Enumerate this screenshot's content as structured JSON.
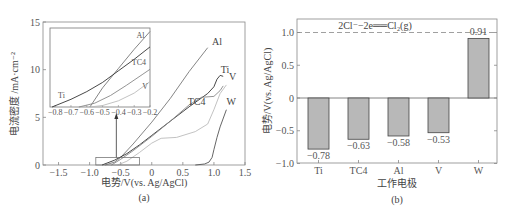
{
  "chart_data": [
    {
      "type": "line",
      "panel_label": "(a)",
      "xlabel": "电势/V(vs. Ag/AgCl)",
      "ylabel": "电流密度 /mA·cm⁻²",
      "xlim": [
        -1.75,
        1.5
      ],
      "ylim": [
        0,
        15
      ],
      "xticks": [
        "-1.5",
        "-1.0",
        "-0.5",
        "0",
        "0.5",
        "1.0",
        "1.5"
      ],
      "xtick_values": [
        -1.5,
        -1.0,
        -0.5,
        0,
        0.5,
        1.0,
        1.5
      ],
      "yticks": [
        "0",
        "5",
        "10",
        "15"
      ],
      "ytick_values": [
        0,
        5,
        10,
        15
      ],
      "series": [
        {
          "name": "Al",
          "color": "#777777",
          "x": [
            -0.75,
            -0.6,
            -0.5,
            -0.3,
            0,
            0.3,
            0.6,
            0.9
          ],
          "y": [
            0,
            0.3,
            0.8,
            2.2,
            4.5,
            7,
            9.8,
            12.3
          ]
        },
        {
          "name": "Ti",
          "color": "#333333",
          "x": [
            -0.8,
            -0.6,
            -0.4,
            -0.2,
            0,
            0.3,
            0.6,
            0.9,
            1.0,
            1.05,
            1.1,
            1.15
          ],
          "y": [
            0,
            0.5,
            1.2,
            2.1,
            3.1,
            4.6,
            6.1,
            7.5,
            8.2,
            9.0,
            9.4,
            9.3
          ]
        },
        {
          "name": "TC4",
          "color": "#888888",
          "x": [
            -0.65,
            -0.5,
            -0.3,
            0,
            0.3,
            0.6,
            0.8,
            1.0,
            1.1,
            1.15
          ],
          "y": [
            0,
            0.6,
            1.5,
            3.0,
            4.6,
            6.3,
            7.1,
            7.2,
            7.8,
            8.3
          ]
        },
        {
          "name": "V",
          "color": "#bbbbbb",
          "x": [
            -0.55,
            -0.4,
            -0.2,
            0,
            0.15,
            0.4,
            0.7,
            0.9,
            1.0,
            1.1,
            1.2
          ],
          "y": [
            0,
            0.4,
            1.3,
            2.3,
            2.8,
            2.9,
            3.5,
            4.3,
            5.8,
            7.5,
            8.4
          ]
        },
        {
          "name": "W",
          "color": "#555555",
          "x": [
            0.7,
            0.85,
            0.92,
            0.97,
            1.0,
            1.05,
            1.1,
            1.2
          ],
          "y": [
            0,
            0.1,
            0.3,
            0.8,
            1.6,
            2.9,
            4.0,
            5.8
          ]
        }
      ],
      "highlight_box": {
        "x": [
          -0.9,
          -0.2
        ],
        "y": [
          0,
          0.8
        ]
      },
      "inset": {
        "xlim": [
          -0.82,
          -0.2
        ],
        "xticks": [
          "-0.8",
          "-0.7",
          "-0.6",
          "-0.5",
          "-0.4",
          "-0.3",
          "-0.2"
        ],
        "xtick_values": [
          -0.8,
          -0.7,
          -0.6,
          -0.5,
          -0.4,
          -0.3,
          -0.2
        ],
        "ylim": [
          0,
          1
        ],
        "series": [
          {
            "name": "Al",
            "x": [
              -0.58,
              -0.5,
              -0.4,
              -0.3,
              -0.2
            ],
            "y": [
              0,
              0.25,
              0.5,
              0.75,
              0.98
            ]
          },
          {
            "name": "Ti",
            "x": [
              -0.82,
              -0.7,
              -0.6,
              -0.5,
              -0.4,
              -0.3,
              -0.2
            ],
            "y": [
              0,
              0.1,
              0.2,
              0.32,
              0.47,
              0.62,
              0.78
            ]
          },
          {
            "name": "TC4",
            "x": [
              -0.65,
              -0.55,
              -0.45,
              -0.35,
              -0.25,
              -0.2
            ],
            "y": [
              0,
              0.05,
              0.15,
              0.28,
              0.42,
              0.49
            ]
          },
          {
            "name": "V",
            "x": [
              -0.58,
              -0.5,
              -0.4,
              -0.3,
              -0.2
            ],
            "y": [
              0,
              0.02,
              0.08,
              0.18,
              0.33
            ]
          }
        ],
        "labels": [
          {
            "text": "Al",
            "x": -0.26,
            "y": 0.9
          },
          {
            "text": "TC4",
            "x": -0.27,
            "y": 0.55
          },
          {
            "text": "Ti",
            "x": -0.76,
            "y": 0.12
          },
          {
            "text": "V",
            "x": -0.23,
            "y": 0.24
          }
        ]
      },
      "labels": [
        {
          "text": "Al",
          "x": 1.05,
          "y": 12.6
        },
        {
          "text": "Ti",
          "x": 1.18,
          "y": 9.7
        },
        {
          "text": "V",
          "x": 1.3,
          "y": 8.9
        },
        {
          "text": "TC4",
          "x": 0.72,
          "y": 6.3
        },
        {
          "text": "W",
          "x": 1.28,
          "y": 6.3
        }
      ]
    },
    {
      "type": "bar",
      "panel_label": "(b)",
      "xlabel": "工作电极",
      "ylabel": "电势/V(vs. Ag/AgCl)",
      "categories": [
        "Ti",
        "TC4",
        "Al",
        "V",
        "W"
      ],
      "values": [
        -0.78,
        -0.63,
        -0.58,
        -0.53,
        0.91
      ],
      "value_labels": [
        "−0.78",
        "−0.63",
        "−0.58",
        "−0.53",
        "0.91"
      ],
      "ylim": [
        -1.0,
        1.2
      ],
      "yticks": [
        "−1.0",
        "−0.5",
        "0",
        "0.5",
        "1.0"
      ],
      "ytick_values": [
        -1.0,
        -0.5,
        0,
        0.5,
        1.0
      ],
      "reference_line": {
        "y": 1.0,
        "label": "2Cl⁻−2e══Cl₂(g)"
      },
      "bar_color": "#b8b8b8"
    }
  ]
}
